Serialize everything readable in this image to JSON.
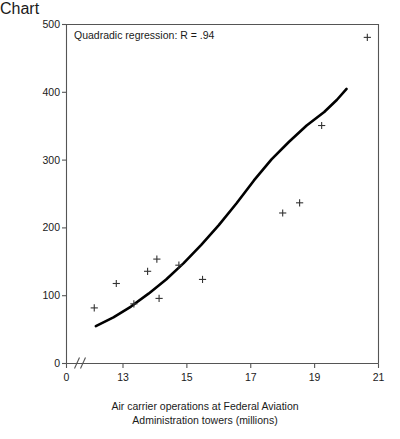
{
  "chart_data": {
    "type": "scatter",
    "title": "",
    "annotation": "Quadradic regression: R = .94",
    "xlabel_line1": "Air carrier operations at Federal Aviation",
    "xlabel_line2": "Administration towers (millions)",
    "ylabel": "Air carrier near midair collisions",
    "xlim": [
      12.2,
      21
    ],
    "ylim": [
      0,
      500
    ],
    "axis_break": true,
    "axis_break_symbol": "\\\\",
    "grid": false,
    "legend": "none",
    "xticks": [
      0,
      13,
      15,
      17,
      19,
      21
    ],
    "xtick_labels": [
      "0",
      "13",
      "15",
      "17",
      "19",
      "21"
    ],
    "yticks": [
      0,
      100,
      200,
      300,
      400,
      500
    ],
    "ytick_labels": [
      "0",
      "100",
      "200",
      "300",
      "400",
      "500"
    ],
    "marker": "plus",
    "marker_color": "#333333",
    "points": [
      {
        "x": 12.1,
        "y": 82
      },
      {
        "x": 12.79,
        "y": 118
      },
      {
        "x": 13.34,
        "y": 88
      },
      {
        "x": 13.77,
        "y": 136
      },
      {
        "x": 14.06,
        "y": 154
      },
      {
        "x": 14.13,
        "y": 96
      },
      {
        "x": 14.75,
        "y": 145
      },
      {
        "x": 15.49,
        "y": 124
      },
      {
        "x": 18.0,
        "y": 222
      },
      {
        "x": 18.53,
        "y": 237
      },
      {
        "x": 19.22,
        "y": 351
      },
      {
        "x": 20.65,
        "y": 481
      }
    ],
    "fit_curve": {
      "label": "quadratic regression fit",
      "color": "#000000",
      "r": 0.94,
      "x_start": 12.15,
      "x_end": 20.0,
      "y_start": 55,
      "y_end": 405,
      "points": [
        {
          "x": 12.15,
          "y": 55
        },
        {
          "x": 12.7,
          "y": 68
        },
        {
          "x": 13.25,
          "y": 84
        },
        {
          "x": 13.8,
          "y": 103
        },
        {
          "x": 14.35,
          "y": 124
        },
        {
          "x": 14.9,
          "y": 148
        },
        {
          "x": 15.45,
          "y": 175
        },
        {
          "x": 16.0,
          "y": 204
        },
        {
          "x": 16.55,
          "y": 236
        },
        {
          "x": 17.1,
          "y": 270
        },
        {
          "x": 17.65,
          "y": 301
        },
        {
          "x": 18.2,
          "y": 327
        },
        {
          "x": 18.75,
          "y": 351
        },
        {
          "x": 19.3,
          "y": 371
        },
        {
          "x": 19.7,
          "y": 389
        },
        {
          "x": 20.0,
          "y": 405
        }
      ]
    }
  },
  "colors": {
    "axis": "#555555",
    "text": "#1a1a1a",
    "curve": "#000000",
    "marker": "#333333",
    "background": "#ffffff"
  }
}
